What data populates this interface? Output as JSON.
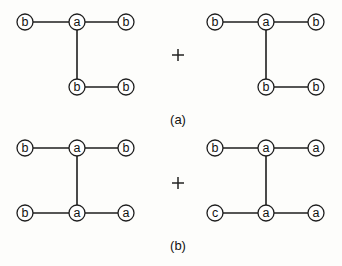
{
  "figure": {
    "node_radius": 8,
    "colors": {
      "stroke": "#1e1e1e",
      "node_fill": "#ffffff",
      "background": "#fdfdfb"
    },
    "panels": [
      {
        "id": "a",
        "caption": "(a)",
        "caption_pos": [
          178,
          119
        ],
        "plus": "+",
        "plus_pos": [
          178,
          55
        ],
        "graphs": [
          {
            "nodes": [
              {
                "id": "n1",
                "label": "b",
                "x": 25,
                "y": 22
              },
              {
                "id": "n2",
                "label": "a",
                "x": 77,
                "y": 22
              },
              {
                "id": "n3",
                "label": "b",
                "x": 126,
                "y": 22
              },
              {
                "id": "n4",
                "label": "b",
                "x": 77,
                "y": 87
              },
              {
                "id": "n5",
                "label": "b",
                "x": 126,
                "y": 87
              }
            ],
            "edges": [
              [
                "n1",
                "n2"
              ],
              [
                "n2",
                "n3"
              ],
              [
                "n2",
                "n4"
              ],
              [
                "n4",
                "n5"
              ]
            ]
          },
          {
            "nodes": [
              {
                "id": "n1",
                "label": "b",
                "x": 215,
                "y": 22
              },
              {
                "id": "n2",
                "label": "a",
                "x": 266,
                "y": 22
              },
              {
                "id": "n3",
                "label": "b",
                "x": 316,
                "y": 22
              },
              {
                "id": "n4",
                "label": "b",
                "x": 266,
                "y": 87
              },
              {
                "id": "n5",
                "label": "b",
                "x": 316,
                "y": 87
              }
            ],
            "edges": [
              [
                "n1",
                "n2"
              ],
              [
                "n2",
                "n3"
              ],
              [
                "n2",
                "n4"
              ],
              [
                "n4",
                "n5"
              ]
            ]
          }
        ]
      },
      {
        "id": "b",
        "caption": "(b)",
        "caption_pos": [
          178,
          245
        ],
        "plus": "+",
        "plus_pos": [
          178,
          183
        ],
        "graphs": [
          {
            "nodes": [
              {
                "id": "n1",
                "label": "b",
                "x": 25,
                "y": 148
              },
              {
                "id": "n2",
                "label": "a",
                "x": 77,
                "y": 148
              },
              {
                "id": "n3",
                "label": "b",
                "x": 126,
                "y": 148
              },
              {
                "id": "n4",
                "label": "b",
                "x": 25,
                "y": 213
              },
              {
                "id": "n5",
                "label": "a",
                "x": 77,
                "y": 213
              },
              {
                "id": "n6",
                "label": "a",
                "x": 126,
                "y": 213
              }
            ],
            "edges": [
              [
                "n1",
                "n2"
              ],
              [
                "n2",
                "n3"
              ],
              [
                "n2",
                "n5"
              ],
              [
                "n4",
                "n5"
              ],
              [
                "n5",
                "n6"
              ]
            ]
          },
          {
            "nodes": [
              {
                "id": "n1",
                "label": "b",
                "x": 215,
                "y": 148
              },
              {
                "id": "n2",
                "label": "a",
                "x": 266,
                "y": 148
              },
              {
                "id": "n3",
                "label": "a",
                "x": 316,
                "y": 148
              },
              {
                "id": "n4",
                "label": "c",
                "x": 215,
                "y": 213
              },
              {
                "id": "n5",
                "label": "a",
                "x": 266,
                "y": 213
              },
              {
                "id": "n6",
                "label": "a",
                "x": 316,
                "y": 213
              }
            ],
            "edges": [
              [
                "n1",
                "n2"
              ],
              [
                "n2",
                "n3"
              ],
              [
                "n2",
                "n5"
              ],
              [
                "n4",
                "n5"
              ],
              [
                "n5",
                "n6"
              ]
            ]
          }
        ]
      }
    ]
  }
}
